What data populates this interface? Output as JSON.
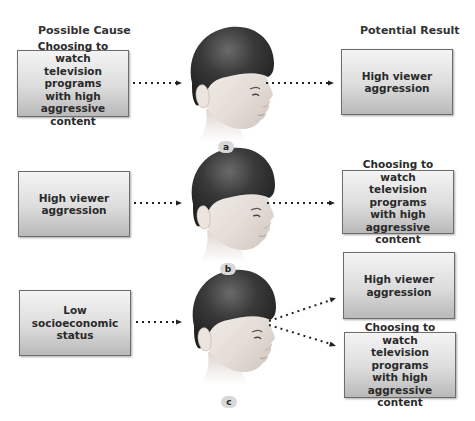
{
  "headers": {
    "left": "Possible Cause",
    "right": "Potential Result"
  },
  "panels": [
    {
      "label": "a",
      "cause": "Choosing to watch\ntelevision programs\nwith high\naggressive content",
      "results": [
        "High viewer\naggression"
      ]
    },
    {
      "label": "b",
      "cause": "High viewer\naggression",
      "results": [
        "Choosing to watch\ntelevision programs\nwith high\naggressive content"
      ]
    },
    {
      "label": "c",
      "cause": "Low\nsocioeconomic\nstatus",
      "results": [
        "High viewer\naggression",
        "Choosing to watch\ntelevision programs\nwith high\naggressive content"
      ]
    }
  ],
  "icons": {
    "head": "child-head-profile-icon",
    "arrow": "dotted-arrow-icon"
  },
  "colors": {
    "box_border": "#6d6d6d",
    "box_fill_top": "#f4f4f4",
    "box_fill_bottom": "#b9b9b9",
    "hair": "#2e2e2e",
    "skin": "#e6dfda",
    "arrow": "#222222",
    "label_bg": "#d8d8d8"
  }
}
